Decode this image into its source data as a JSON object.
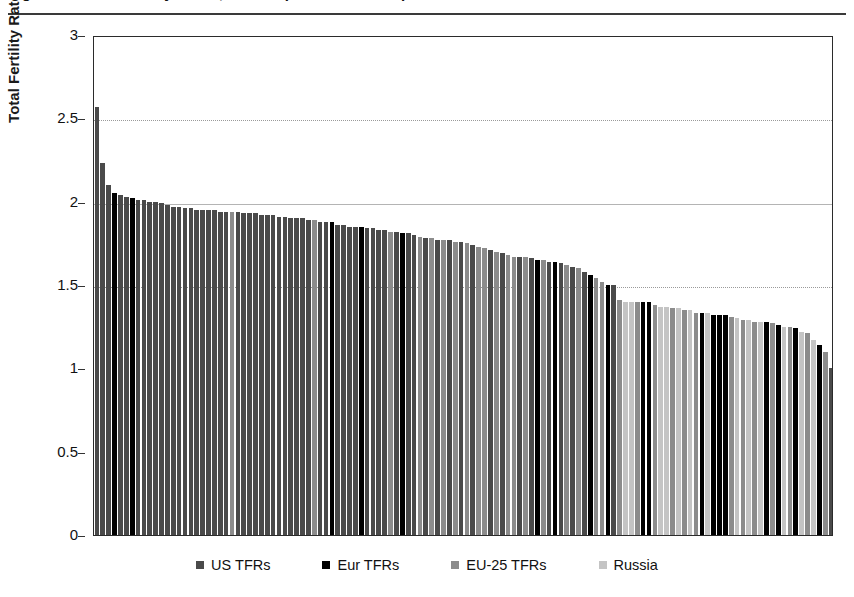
{
  "figure": {
    "title": "Figure 2. Total Fertility Rates, US compared with Europe and Russia",
    "title_visible_note": "clipped at top edge"
  },
  "axes": {
    "y_axis_label": "Total Fertility Rate",
    "y_ticks": [
      "0",
      "0.5",
      "1",
      "1.5",
      "2",
      "2.5",
      "3"
    ]
  },
  "legend": {
    "items": [
      {
        "label": "US TFRs",
        "color": "#4a4a4a"
      },
      {
        "label": "Eur TFRs",
        "color": "#000000"
      },
      {
        "label": "EU-25 TFRs",
        "color": "#8c8c8c"
      },
      {
        "label": "Russia",
        "color": "#c4c4c4"
      }
    ]
  },
  "chart_data": {
    "type": "bar",
    "title": "Figure 2. Total Fertility Rates, US compared with Europe and Russia",
    "xlabel": "",
    "ylabel": "Total Fertility Rate",
    "ylim": [
      0,
      3
    ],
    "yticks": [
      0,
      0.5,
      1,
      1.5,
      2,
      2.5,
      3
    ],
    "gridlines": {
      "dotted": [
        2.5,
        1.5
      ],
      "solid": [
        2.0
      ]
    },
    "grid": true,
    "legend_position": "bottom",
    "sorted": "descending",
    "series_colors": {
      "US TFRs": "#4a4a4a",
      "Eur TFRs": "#000000",
      "EU-25 TFRs": "#8c8c8c",
      "Russia": "#c4c4c4"
    },
    "bars": [
      {
        "value": 2.57,
        "series": "US TFRs"
      },
      {
        "value": 2.23,
        "series": "US TFRs"
      },
      {
        "value": 2.1,
        "series": "US TFRs"
      },
      {
        "value": 2.05,
        "series": "Eur TFRs"
      },
      {
        "value": 2.04,
        "series": "US TFRs"
      },
      {
        "value": 2.03,
        "series": "US TFRs"
      },
      {
        "value": 2.02,
        "series": "Eur TFRs"
      },
      {
        "value": 2.01,
        "series": "US TFRs"
      },
      {
        "value": 2.01,
        "series": "US TFRs"
      },
      {
        "value": 2.0,
        "series": "US TFRs"
      },
      {
        "value": 2.0,
        "series": "US TFRs"
      },
      {
        "value": 1.99,
        "series": "US TFRs"
      },
      {
        "value": 1.98,
        "series": "US TFRs"
      },
      {
        "value": 1.97,
        "series": "US TFRs"
      },
      {
        "value": 1.97,
        "series": "US TFRs"
      },
      {
        "value": 1.96,
        "series": "US TFRs"
      },
      {
        "value": 1.96,
        "series": "US TFRs"
      },
      {
        "value": 1.95,
        "series": "US TFRs"
      },
      {
        "value": 1.95,
        "series": "US TFRs"
      },
      {
        "value": 1.95,
        "series": "US TFRs"
      },
      {
        "value": 1.95,
        "series": "US TFRs"
      },
      {
        "value": 1.94,
        "series": "US TFRs"
      },
      {
        "value": 1.94,
        "series": "US TFRs"
      },
      {
        "value": 1.94,
        "series": "EU-25 TFRs"
      },
      {
        "value": 1.94,
        "series": "US TFRs"
      },
      {
        "value": 1.93,
        "series": "US TFRs"
      },
      {
        "value": 1.93,
        "series": "US TFRs"
      },
      {
        "value": 1.93,
        "series": "US TFRs"
      },
      {
        "value": 1.92,
        "series": "US TFRs"
      },
      {
        "value": 1.92,
        "series": "US TFRs"
      },
      {
        "value": 1.92,
        "series": "US TFRs"
      },
      {
        "value": 1.91,
        "series": "US TFRs"
      },
      {
        "value": 1.91,
        "series": "US TFRs"
      },
      {
        "value": 1.9,
        "series": "US TFRs"
      },
      {
        "value": 1.9,
        "series": "US TFRs"
      },
      {
        "value": 1.9,
        "series": "US TFRs"
      },
      {
        "value": 1.89,
        "series": "US TFRs"
      },
      {
        "value": 1.89,
        "series": "EU-25 TFRs"
      },
      {
        "value": 1.88,
        "series": "US TFRs"
      },
      {
        "value": 1.88,
        "series": "US TFRs"
      },
      {
        "value": 1.88,
        "series": "Eur TFRs"
      },
      {
        "value": 1.86,
        "series": "US TFRs"
      },
      {
        "value": 1.86,
        "series": "US TFRs"
      },
      {
        "value": 1.85,
        "series": "US TFRs"
      },
      {
        "value": 1.85,
        "series": "US TFRs"
      },
      {
        "value": 1.85,
        "series": "Eur TFRs"
      },
      {
        "value": 1.84,
        "series": "US TFRs"
      },
      {
        "value": 1.84,
        "series": "US TFRs"
      },
      {
        "value": 1.83,
        "series": "US TFRs"
      },
      {
        "value": 1.83,
        "series": "US TFRs"
      },
      {
        "value": 1.82,
        "series": "EU-25 TFRs"
      },
      {
        "value": 1.82,
        "series": "US TFRs"
      },
      {
        "value": 1.81,
        "series": "Eur TFRs"
      },
      {
        "value": 1.81,
        "series": "US TFRs"
      },
      {
        "value": 1.8,
        "series": "US TFRs"
      },
      {
        "value": 1.79,
        "series": "EU-25 TFRs"
      },
      {
        "value": 1.78,
        "series": "US TFRs"
      },
      {
        "value": 1.78,
        "series": "EU-25 TFRs"
      },
      {
        "value": 1.77,
        "series": "US TFRs"
      },
      {
        "value": 1.77,
        "series": "EU-25 TFRs"
      },
      {
        "value": 1.77,
        "series": "US TFRs"
      },
      {
        "value": 1.76,
        "series": "EU-25 TFRs"
      },
      {
        "value": 1.76,
        "series": "US TFRs"
      },
      {
        "value": 1.75,
        "series": "EU-25 TFRs"
      },
      {
        "value": 1.74,
        "series": "US TFRs"
      },
      {
        "value": 1.73,
        "series": "EU-25 TFRs"
      },
      {
        "value": 1.72,
        "series": "EU-25 TFRs"
      },
      {
        "value": 1.71,
        "series": "US TFRs"
      },
      {
        "value": 1.7,
        "series": "EU-25 TFRs"
      },
      {
        "value": 1.69,
        "series": "US TFRs"
      },
      {
        "value": 1.68,
        "series": "EU-25 TFRs"
      },
      {
        "value": 1.67,
        "series": "EU-25 TFRs"
      },
      {
        "value": 1.67,
        "series": "US TFRs"
      },
      {
        "value": 1.67,
        "series": "EU-25 TFRs"
      },
      {
        "value": 1.66,
        "series": "US TFRs"
      },
      {
        "value": 1.65,
        "series": "Eur TFRs"
      },
      {
        "value": 1.65,
        "series": "EU-25 TFRs"
      },
      {
        "value": 1.64,
        "series": "US TFRs"
      },
      {
        "value": 1.64,
        "series": "Eur TFRs"
      },
      {
        "value": 1.63,
        "series": "US TFRs"
      },
      {
        "value": 1.62,
        "series": "EU-25 TFRs"
      },
      {
        "value": 1.61,
        "series": "US TFRs"
      },
      {
        "value": 1.6,
        "series": "EU-25 TFRs"
      },
      {
        "value": 1.58,
        "series": "US TFRs"
      },
      {
        "value": 1.56,
        "series": "Eur TFRs"
      },
      {
        "value": 1.54,
        "series": "EU-25 TFRs"
      },
      {
        "value": 1.52,
        "series": "EU-25 TFRs"
      },
      {
        "value": 1.5,
        "series": "Eur TFRs"
      },
      {
        "value": 1.5,
        "series": "US TFRs"
      },
      {
        "value": 1.41,
        "series": "EU-25 TFRs"
      },
      {
        "value": 1.4,
        "series": "Russia"
      },
      {
        "value": 1.4,
        "series": "Russia"
      },
      {
        "value": 1.4,
        "series": "EU-25 TFRs"
      },
      {
        "value": 1.4,
        "series": "Eur TFRs"
      },
      {
        "value": 1.4,
        "series": "Eur TFRs"
      },
      {
        "value": 1.38,
        "series": "EU-25 TFRs"
      },
      {
        "value": 1.37,
        "series": "Russia"
      },
      {
        "value": 1.37,
        "series": "Russia"
      },
      {
        "value": 1.36,
        "series": "EU-25 TFRs"
      },
      {
        "value": 1.36,
        "series": "Russia"
      },
      {
        "value": 1.35,
        "series": "EU-25 TFRs"
      },
      {
        "value": 1.35,
        "series": "Russia"
      },
      {
        "value": 1.33,
        "series": "EU-25 TFRs"
      },
      {
        "value": 1.33,
        "series": "Eur TFRs"
      },
      {
        "value": 1.33,
        "series": "Russia"
      },
      {
        "value": 1.32,
        "series": "Eur TFRs"
      },
      {
        "value": 1.32,
        "series": "Eur TFRs"
      },
      {
        "value": 1.32,
        "series": "Eur TFRs"
      },
      {
        "value": 1.31,
        "series": "EU-25 TFRs"
      },
      {
        "value": 1.3,
        "series": "Russia"
      },
      {
        "value": 1.29,
        "series": "EU-25 TFRs"
      },
      {
        "value": 1.29,
        "series": "Russia"
      },
      {
        "value": 1.28,
        "series": "EU-25 TFRs"
      },
      {
        "value": 1.28,
        "series": "Russia"
      },
      {
        "value": 1.28,
        "series": "Eur TFRs"
      },
      {
        "value": 1.27,
        "series": "EU-25 TFRs"
      },
      {
        "value": 1.26,
        "series": "Eur TFRs"
      },
      {
        "value": 1.25,
        "series": "Russia"
      },
      {
        "value": 1.25,
        "series": "EU-25 TFRs"
      },
      {
        "value": 1.24,
        "series": "Eur TFRs"
      },
      {
        "value": 1.22,
        "series": "Russia"
      },
      {
        "value": 1.21,
        "series": "EU-25 TFRs"
      },
      {
        "value": 1.17,
        "series": "Russia"
      },
      {
        "value": 1.14,
        "series": "Eur TFRs"
      },
      {
        "value": 1.1,
        "series": "EU-25 TFRs"
      },
      {
        "value": 1.0,
        "series": "US TFRs"
      }
    ]
  }
}
